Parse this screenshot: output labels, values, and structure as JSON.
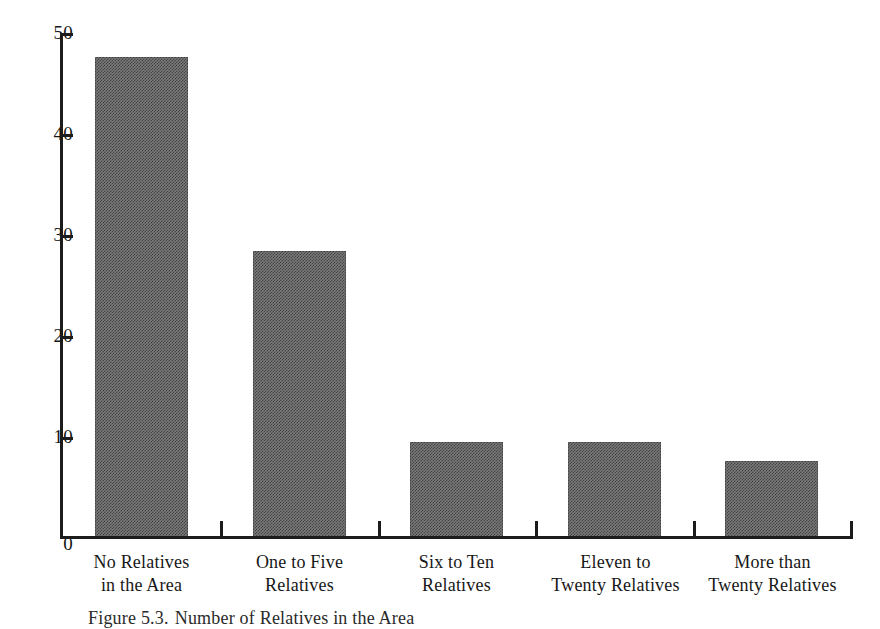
{
  "figure": {
    "caption_label": "Figure 5.3.",
    "caption_text": "Number of Relatives in the Area",
    "background_color": "#ffffff",
    "bar_color": "#7b7b7b",
    "axis_color": "#1c1c1c"
  },
  "chart_data": {
    "type": "bar",
    "title": "",
    "subtitle": "",
    "xlabel": "",
    "ylabel": "",
    "categories": [
      "No Relatives in the Area",
      "One to Five Relatives",
      "Six to Ten Relatives",
      "Eleven to Twenty Relatives",
      "More than Twenty Relatives"
    ],
    "category_lines": [
      [
        "No Relatives",
        "in the Area"
      ],
      [
        "One to Five",
        "Relatives"
      ],
      [
        "Six to Ten",
        "Relatives"
      ],
      [
        "Eleven to",
        "Twenty Relatives"
      ],
      [
        "More than",
        "Twenty Relatives"
      ]
    ],
    "values": [
      47.5,
      28.3,
      9.4,
      9.4,
      7.5
    ],
    "ylim": [
      0,
      50
    ],
    "yticks": [
      0,
      10,
      20,
      30,
      40,
      50
    ],
    "ytick_labels": [
      "0",
      "10",
      "20",
      "30",
      "40",
      "50"
    ],
    "grid": false,
    "legend": null,
    "legend_position": "none"
  }
}
